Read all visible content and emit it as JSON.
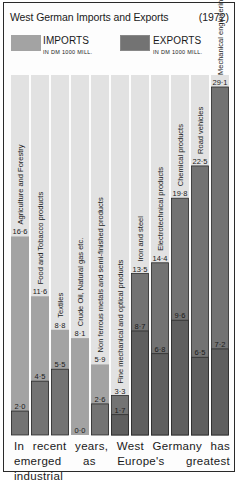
{
  "chart_data": {
    "type": "bar",
    "title": "West German Imports and Exports",
    "year_label": "(1972)",
    "xlabel": "",
    "ylabel": "",
    "ylim": [
      0,
      29.1
    ],
    "grid": false,
    "legend_position": "top",
    "categories": [
      "Agriculture and Forestry",
      "Food and Tobacco products",
      "Textiles",
      "Crude Oil, Natural gas etc.",
      "Non ferrous metals and semi-finished products",
      "Fine mechanical and optical products",
      "Iron and steel",
      "Electrotechnical products",
      "Chemical products",
      "Road vehicles",
      "Mechanical engineering products"
    ],
    "series": [
      {
        "name": "IMPORTS",
        "unit": "IN DM 1000 MILL.",
        "color": "#a3a3a3",
        "values": [
          16.6,
          11.6,
          8.8,
          8.1,
          5.9,
          1.7,
          8.7,
          6.8,
          9.6,
          6.5,
          7.2
        ],
        "labels": [
          "16·6",
          "11·6",
          "8·8",
          "8·1",
          "5·9",
          "1·7",
          "8·7",
          "6·8",
          "9·6",
          "6·5",
          "7·2"
        ]
      },
      {
        "name": "EXPORTS",
        "unit": "IN DM 1000 MILL.",
        "color": "#737373",
        "values": [
          2.0,
          4.5,
          5.5,
          0.0,
          2.6,
          3.3,
          13.5,
          14.4,
          19.8,
          22.5,
          29.1
        ],
        "labels": [
          "2·0",
          "4·5",
          "5·5",
          "0·0",
          "2·6",
          "3·3",
          "13·5",
          "14·4",
          "19·8",
          "22·5",
          "29·1"
        ]
      }
    ]
  },
  "colors": {
    "column_background": "#e2e2e2",
    "bar_border": "#2b2b2b",
    "overlap": "#5e5e5e"
  },
  "caption": {
    "line1": "In recent years, West Germany has",
    "line2": "emerged as Europe's greatest industrial"
  }
}
